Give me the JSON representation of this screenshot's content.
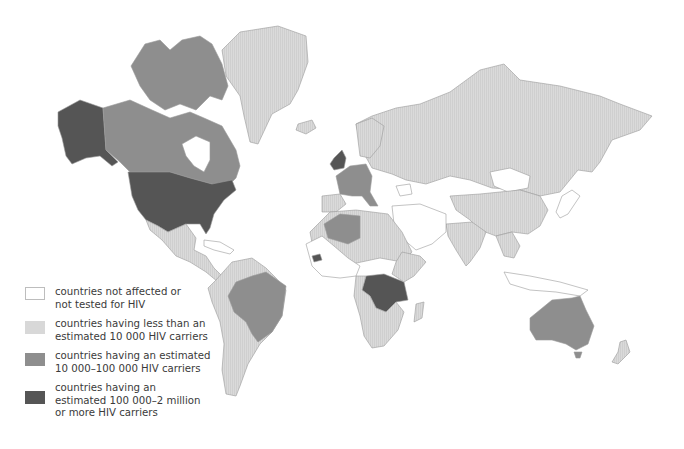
{
  "map": {
    "title": "World distribution of HIV carriers",
    "colors": {
      "none": "#ffffff",
      "low": "#d8d8d8",
      "medium": "#8e8e8e",
      "high": "#555555",
      "border": "#9a9a9a"
    },
    "regions": [
      {
        "name": "Alaska",
        "category": "high"
      },
      {
        "name": "Canada",
        "category": "medium"
      },
      {
        "name": "United States",
        "category": "high"
      },
      {
        "name": "Greenland",
        "category": "low"
      },
      {
        "name": "Mexico",
        "category": "low"
      },
      {
        "name": "Central America",
        "category": "low"
      },
      {
        "name": "Brazil",
        "category": "medium"
      },
      {
        "name": "South America (rest)",
        "category": "low"
      },
      {
        "name": "United Kingdom",
        "category": "high"
      },
      {
        "name": "Western Europe (France, Germany, Italy)",
        "category": "medium"
      },
      {
        "name": "Iberia",
        "category": "low"
      },
      {
        "name": "Scandinavia",
        "category": "low"
      },
      {
        "name": "Russia / USSR",
        "category": "low"
      },
      {
        "name": "Mongolia",
        "category": "none"
      },
      {
        "name": "China",
        "category": "low"
      },
      {
        "name": "Japan",
        "category": "none"
      },
      {
        "name": "India",
        "category": "low"
      },
      {
        "name": "Southeast Asia",
        "category": "low"
      },
      {
        "name": "Indonesia",
        "category": "none"
      },
      {
        "name": "Algeria",
        "category": "medium"
      },
      {
        "name": "North Africa (rest)",
        "category": "low"
      },
      {
        "name": "Arabian Peninsula",
        "category": "none"
      },
      {
        "name": "Central Africa (Zaire, Uganda, Tanzania, Zambia)",
        "category": "high"
      },
      {
        "name": "Senegambia",
        "category": "high"
      },
      {
        "name": "Southern Africa",
        "category": "low"
      },
      {
        "name": "Madagascar",
        "category": "low"
      },
      {
        "name": "Australia",
        "category": "medium"
      },
      {
        "name": "New Zealand",
        "category": "low"
      }
    ]
  },
  "legend": {
    "items": [
      {
        "key": "none",
        "color": "#ffffff",
        "lines": [
          "countries not affected or",
          "not tested for HIV"
        ]
      },
      {
        "key": "low",
        "color": "#d8d8d8",
        "lines": [
          "countries having less than an",
          "estimated 10 000 HIV carriers"
        ]
      },
      {
        "key": "medium",
        "color": "#8e8e8e",
        "lines": [
          "countries having an estimated",
          "10 000–100 000 HIV carriers"
        ]
      },
      {
        "key": "high",
        "color": "#555555",
        "lines": [
          "countries having an",
          "estimated 100 000–2 million",
          "or more HIV carriers"
        ]
      }
    ]
  }
}
